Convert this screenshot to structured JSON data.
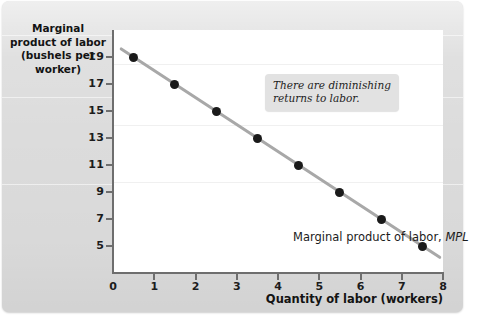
{
  "chart_data": {
    "type": "scatter",
    "title": "",
    "xlabel": "Quantity of labor (workers)",
    "ylabel": "Marginal product of labor (bushels per worker)",
    "ylabel_lines": [
      "Marginal",
      "product of labor",
      "(bushels per",
      "worker)"
    ],
    "x": [
      0.5,
      1.5,
      2.5,
      3.5,
      4.5,
      5.5,
      6.5,
      7.5
    ],
    "values": [
      19,
      17,
      15,
      13,
      11,
      9,
      7,
      5
    ],
    "series": [
      {
        "name": "Marginal product of labor, MPL",
        "x": [
          0.5,
          1.5,
          2.5,
          3.5,
          4.5,
          5.5,
          6.5,
          7.5
        ],
        "values": [
          19,
          17,
          15,
          13,
          11,
          9,
          7,
          5
        ]
      }
    ],
    "xlim": [
      0,
      8
    ],
    "ylim": [
      3,
      21
    ],
    "xticks": [
      0,
      1,
      2,
      3,
      4,
      5,
      6,
      7,
      8
    ],
    "xticklabels": [
      "0",
      "1",
      "2",
      "3",
      "4",
      "5",
      "6",
      "7",
      "8"
    ],
    "yticks": [
      19,
      17,
      15,
      13,
      11,
      9,
      7,
      5
    ],
    "yticklabels": [
      "19",
      "17",
      "15",
      "13",
      "11",
      "9",
      "7",
      "5"
    ],
    "grid": false,
    "legend_position": "none",
    "line_color": "#a8a8a8",
    "point_color": "#1a1a1a",
    "plot_background": "#ffffff",
    "figure_background": "#dcdcdc"
  },
  "series_label": {
    "text": "Marginal product of labor, ",
    "emphasis": "MPL"
  },
  "annotation": {
    "text": "There are diminishing\nreturns to labor."
  }
}
